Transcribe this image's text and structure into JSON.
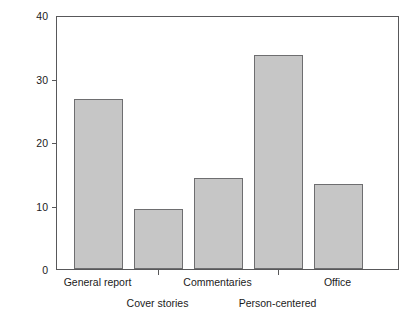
{
  "chart_data": {
    "type": "bar",
    "title": "",
    "subtitle": "",
    "xlabel": "",
    "ylabel": "% Stories with allusions",
    "categories": [
      "General report",
      "Cover stories",
      "Commentaries",
      "Person-centered",
      "Office"
    ],
    "values": [
      26.8,
      9.4,
      14.4,
      33.7,
      13.4
    ],
    "ylim": [
      0,
      40
    ],
    "yticks": [
      0,
      10,
      20,
      30,
      40
    ],
    "ytick_labels": [
      "0",
      "10",
      "20",
      "30",
      "40"
    ],
    "grid": false,
    "legend": null,
    "label_rows": [
      "top",
      "bottom",
      "top",
      "bottom",
      "top"
    ],
    "colors": {
      "bar_fill": "#c6c6c6",
      "bar_border": "#6e6e70",
      "axis": "#58585a",
      "text": "#1b1b1b",
      "background": "#ffffff"
    }
  },
  "axes": {
    "y_label_text": "% Stories with allusions"
  }
}
